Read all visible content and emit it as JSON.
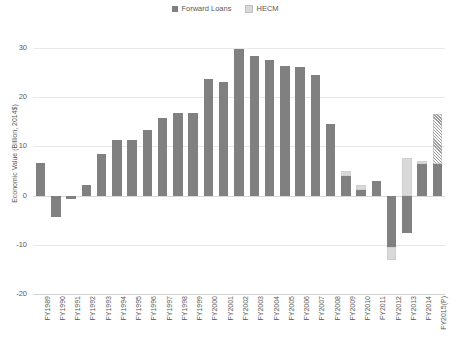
{
  "legend": {
    "items": [
      {
        "label": "Forward Loans",
        "color": "#808080",
        "key": "forward"
      },
      {
        "label": "HECM",
        "color": "#d9d9d9",
        "key": "hecm"
      }
    ]
  },
  "axes": {
    "ylabel": "Economic Value (Billion, 2014$)",
    "yticks": [
      "30",
      "20",
      "10",
      "0",
      "-10",
      "-20"
    ]
  },
  "chart_data": {
    "type": "bar",
    "title": "",
    "xlabel": "",
    "ylabel": "Economic Value (Billion, 2014$)",
    "ylim": [
      -20,
      30
    ],
    "ytick_values": [
      30,
      20,
      10,
      0,
      -10,
      -20
    ],
    "grid": true,
    "legend_position": "top-center",
    "stacked": true,
    "categories": [
      "FY1989",
      "FY1990",
      "FY1991",
      "FY1992",
      "FY1993",
      "FY1994",
      "FY1995",
      "FY1996",
      "FY1997",
      "FY1998",
      "FY1999",
      "FY2000",
      "FY2001",
      "FY2002",
      "FY2003",
      "FY2004",
      "FY2005",
      "FY2006",
      "FY2007",
      "FY2008",
      "FY2009",
      "FY2010",
      "FY2011",
      "FY2012",
      "FY2013",
      "FY2014",
      "FY2015(P)"
    ],
    "series": [
      {
        "name": "Forward Loans",
        "color": "#808080",
        "values": [
          6.6,
          -4.4,
          -0.7,
          2.2,
          8.5,
          11.2,
          11.3,
          13.4,
          15.8,
          16.7,
          16.7,
          23.8,
          23.1,
          29.8,
          28.3,
          27.6,
          26.4,
          26.2,
          24.5,
          14.6,
          3.9,
          1.2,
          3.0,
          -10.4,
          -7.6,
          6.4,
          6.4
        ]
      },
      {
        "name": "HECM",
        "color": "#d9d9d9",
        "values": [
          0,
          0,
          0,
          0,
          0,
          0,
          0,
          0,
          0,
          0,
          0,
          0,
          0,
          0,
          0,
          0,
          0,
          0,
          0,
          0,
          1.1,
          0.9,
          0,
          -2.6,
          7.6,
          0.7,
          10.2
        ]
      }
    ],
    "projected_category": "FY2015(P)"
  }
}
